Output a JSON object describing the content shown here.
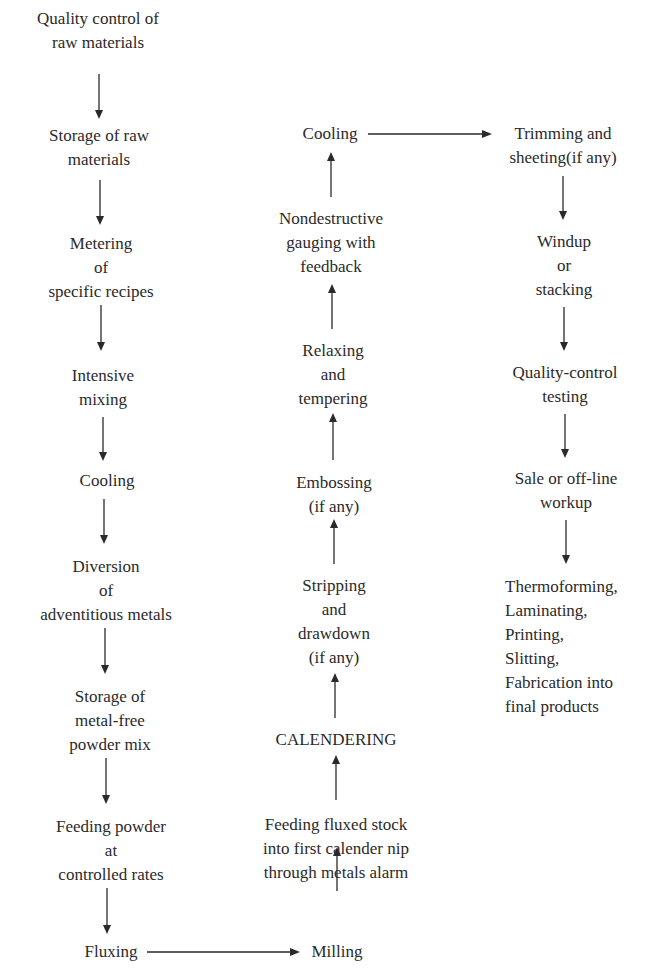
{
  "diagram": {
    "type": "process-flowchart",
    "columns": [
      {
        "name": "column-1",
        "direction": "down",
        "nodes": [
          {
            "id": "qc-raw",
            "lines": [
              "Quality control of",
              "raw materials"
            ]
          },
          {
            "id": "storage-raw",
            "lines": [
              "Storage of raw",
              "materials"
            ]
          },
          {
            "id": "metering",
            "lines": [
              "Metering",
              "of",
              "specific recipes"
            ]
          },
          {
            "id": "mixing",
            "lines": [
              "Intensive",
              "mixing"
            ]
          },
          {
            "id": "cooling-1",
            "lines": [
              "Cooling"
            ]
          },
          {
            "id": "diversion",
            "lines": [
              "Diversion",
              "of",
              "adventitious metals"
            ]
          },
          {
            "id": "storage-powder",
            "lines": [
              "Storage of",
              "metal-free",
              "powder mix"
            ]
          },
          {
            "id": "feeding-powder",
            "lines": [
              "Feeding powder",
              "at",
              "controlled rates"
            ]
          },
          {
            "id": "fluxing",
            "lines": [
              "Fluxing"
            ]
          }
        ]
      },
      {
        "name": "column-2",
        "direction": "up",
        "nodes": [
          {
            "id": "milling",
            "lines": [
              "Milling"
            ]
          },
          {
            "id": "feeding-stock",
            "lines": [
              "Feeding fluxed stock",
              "into first calender nip",
              "through metals alarm"
            ]
          },
          {
            "id": "calendering",
            "lines": [
              "CALENDERING"
            ]
          },
          {
            "id": "stripping",
            "lines": [
              "Stripping",
              "and",
              "drawdown",
              "(if any)"
            ]
          },
          {
            "id": "embossing",
            "lines": [
              "Embossing",
              "(if any)"
            ]
          },
          {
            "id": "relaxing",
            "lines": [
              "Relaxing",
              "and",
              "tempering"
            ]
          },
          {
            "id": "gauging",
            "lines": [
              "Nondestructive",
              "gauging with",
              "feedback"
            ]
          },
          {
            "id": "cooling-2",
            "lines": [
              "Cooling"
            ]
          }
        ]
      },
      {
        "name": "column-3",
        "direction": "down",
        "nodes": [
          {
            "id": "trimming",
            "lines": [
              "Trimming and",
              "sheeting(if any)"
            ]
          },
          {
            "id": "windup",
            "lines": [
              "Windup",
              "or",
              "stacking"
            ]
          },
          {
            "id": "qc-testing",
            "lines": [
              "Quality-control",
              "testing"
            ]
          },
          {
            "id": "sale",
            "lines": [
              "Sale or off-line",
              "workup"
            ]
          },
          {
            "id": "final",
            "lines": [
              "Thermoforming,",
              "Laminating,",
              "Printing,",
              "Slitting,",
              "Fabrication into",
              "final products"
            ]
          }
        ]
      }
    ],
    "connections": [
      {
        "from": "fluxing",
        "to": "milling",
        "direction": "right"
      },
      {
        "from": "cooling-2",
        "to": "trimming",
        "direction": "right"
      }
    ],
    "colors": {
      "ink": "#2a2a2a",
      "background": "#ffffff"
    }
  }
}
